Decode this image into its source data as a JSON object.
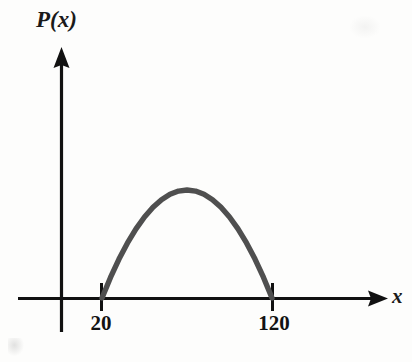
{
  "figure": {
    "title": "",
    "y_axis_label": "P(x)",
    "x_axis_label": "x",
    "tick_left_label": "20",
    "tick_right_label": "120",
    "curve_color": "#4f4f4f",
    "axis_color": "#111111",
    "background_color": "#fdfdfc"
  },
  "chart_data": {
    "type": "line",
    "title": "",
    "xlabel": "x",
    "ylabel": "P(x)",
    "xlim": [
      0,
      150
    ],
    "ylim": [
      0,
      3000
    ],
    "grid": false,
    "legend": null,
    "xticks": [
      20,
      120
    ],
    "xticklabels": [
      "20",
      "120"
    ],
    "yticks": [],
    "yticklabels": [],
    "annotations": [],
    "series": [
      {
        "name": "P(x)",
        "description": "Downward-opening parabola with x-intercepts (roots) at x = 20 and x = 120, vertex (maximum) at x = 70.",
        "color": "#4f4f4f",
        "roots": [
          20,
          120
        ],
        "vertex_x": 70,
        "vertex_y": 2500,
        "x": [
          20,
          25,
          30,
          35,
          40,
          45,
          50,
          55,
          60,
          65,
          70,
          75,
          80,
          85,
          90,
          95,
          100,
          105,
          110,
          115,
          120
        ],
        "y": [
          0,
          475,
          900,
          1275,
          1600,
          1875,
          2100,
          2275,
          2400,
          2475,
          2500,
          2475,
          2400,
          2275,
          2100,
          1875,
          1600,
          1275,
          900,
          475,
          0
        ]
      }
    ]
  }
}
